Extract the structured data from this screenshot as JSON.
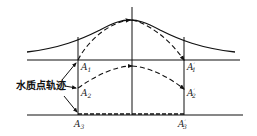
{
  "diagram": {
    "title": "",
    "caption_label": "水质点轨迹",
    "labels": {
      "A1": {
        "base": "A",
        "sub": "1",
        "prime": ""
      },
      "A2": {
        "base": "A",
        "sub": "2",
        "prime": ""
      },
      "A3": {
        "base": "A",
        "sub": "3",
        "prime": ""
      },
      "A1p": {
        "base": "A",
        "sub": "1",
        "prime": "′"
      },
      "A2p": {
        "base": "A",
        "sub": "2",
        "prime": "′"
      },
      "A3p": {
        "base": "A",
        "sub": "3",
        "prime": "′"
      }
    },
    "elements": [
      "bell-shaped wave crest profile",
      "still water line (upper horizontal)",
      "bottom line (lower horizontal)",
      "left vertical A-line",
      "center vertical line",
      "right vertical A′-line",
      "dashed trajectory A1 to crest to A1′",
      "dashed trajectory A2 to A2′",
      "dashed trajectory A3 to A3′ along bottom"
    ],
    "colors": {
      "stroke": "#111111",
      "background": "#ffffff"
    }
  }
}
